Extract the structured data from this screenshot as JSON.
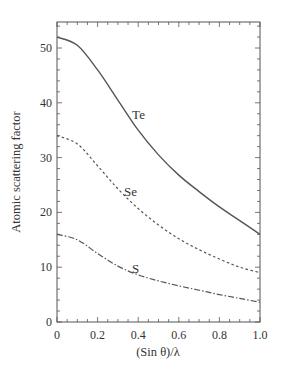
{
  "chart_data": {
    "type": "line",
    "title": "",
    "xlabel": "(Sin θ)/λ",
    "ylabel": "Atomic scattering factor",
    "xlim": [
      0,
      1.0
    ],
    "ylim": [
      0,
      55
    ],
    "grid": false,
    "legend": "inline labels",
    "x_ticks": [
      0,
      0.2,
      0.4,
      0.6,
      0.8,
      1.0
    ],
    "x_tick_labels": [
      "0",
      "0.2",
      "0.4",
      "0.6",
      "0.8",
      "1.0"
    ],
    "y_ticks": [
      0,
      10,
      20,
      30,
      40,
      50
    ],
    "y_tick_labels": [
      "0",
      "10",
      "20",
      "30",
      "40",
      "50"
    ],
    "x": [
      0,
      0.1,
      0.2,
      0.3,
      0.4,
      0.5,
      0.6,
      0.7,
      0.8,
      0.9,
      1.0
    ],
    "series": [
      {
        "name": "Te",
        "style": "solid",
        "values": [
          52,
          50.5,
          46,
          40.5,
          35,
          30.5,
          26.8,
          23.8,
          21,
          18.5,
          16
        ]
      },
      {
        "name": "Se",
        "style": "dashed",
        "values": [
          34,
          32.5,
          28.5,
          24.3,
          20.7,
          17.7,
          15.2,
          13.2,
          11.5,
          10,
          9
        ]
      },
      {
        "name": "S",
        "style": "dash-dot",
        "values": [
          16,
          15,
          12.5,
          10.2,
          8.6,
          7.5,
          6.6,
          5.8,
          5,
          4.3,
          3.6
        ]
      }
    ],
    "annotations": [
      {
        "text": "Te",
        "x": 0.37,
        "y": 37
      },
      {
        "text": "Se",
        "x": 0.33,
        "y": 23
      },
      {
        "text": "S",
        "x": 0.37,
        "y": 9
      }
    ]
  }
}
